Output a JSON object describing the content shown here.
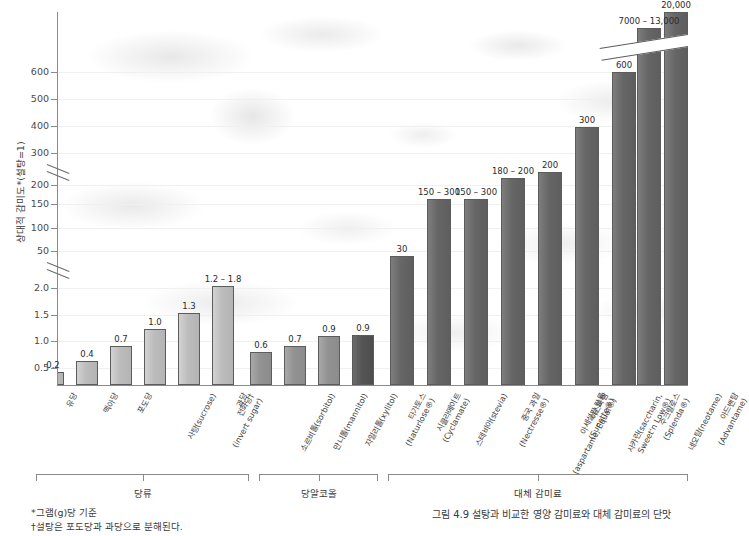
{
  "chart_data": {
    "type": "bar",
    "title": "",
    "ylabel": "상대적 감미도*(설탕=1)",
    "xlabel": "",
    "grid": true,
    "legend": "none",
    "y_axis": {
      "tick_labels": [
        "600",
        "500",
        "400",
        "300",
        "200",
        "150",
        "100",
        "50",
        "2.0",
        "1.5",
        "1.0",
        "0.5"
      ],
      "breaks": 2,
      "note": "두 번의 축 절단(axis break) 포함"
    },
    "categories": [
      "유당",
      "맥아당",
      "포도당",
      "사탕(sucrose)",
      "전화당†(invert sugar)",
      "과당",
      "소르비톨(sorbitol)",
      "만니톨(mannitol)",
      "자일리톨(xylitol)",
      "타가토스(Naturlose®)",
      "시클라메이트(Cyclamate)",
      "스테비아(stevia)",
      "중국 과일(Nectresse®)",
      "아스파탐(aspartame, Equal®)",
      "아세설팜 칼륨(Sunette®)",
      "사카린(saccharin, Sweet'n Low®)",
      "수크랄로스(Splenda®)",
      "네오탐(neotame)",
      "아드밴탐(Advantame)"
    ],
    "values": [
      0.2,
      0.4,
      0.7,
      1.0,
      1.3,
      1.8,
      0.6,
      0.7,
      0.9,
      0.9,
      30,
      225,
      225,
      190,
      200,
      300,
      600,
      13000,
      20000
    ],
    "value_labels": [
      "0.2",
      "0.4",
      "0.7",
      "1.0",
      "1.3",
      "1.2 – 1.8",
      "0.6",
      "0.7",
      "0.9",
      "0.9",
      "30",
      "150 – 300",
      "150 – 300",
      "180 – 200",
      "200",
      "300",
      "600",
      "7000 – 13,000",
      "20,000"
    ],
    "groups": [
      {
        "label": "당류",
        "from": 0,
        "to": 5
      },
      {
        "label": "당알코올",
        "from": 6,
        "to": 9
      },
      {
        "label": "대체 감미료",
        "from": 10,
        "to": 18
      }
    ]
  },
  "bars": [
    {
      "name": "lactose",
      "label": "유당",
      "label2": "",
      "value_label": "0.2",
      "x": 42,
      "w": 22,
      "h": 13,
      "tone": "light"
    },
    {
      "name": "maltose",
      "label": "맥아당",
      "label2": "",
      "value_label": "0.4",
      "x": 76,
      "w": 22,
      "h": 24,
      "tone": "light"
    },
    {
      "name": "glucose",
      "label": "포도당",
      "label2": "",
      "value_label": "0.7",
      "x": 110,
      "w": 22,
      "h": 39,
      "tone": "light"
    },
    {
      "name": "sucrose",
      "label": "사탕(sucrose)",
      "label2": "",
      "value_label": "1.0",
      "x": 144,
      "w": 22,
      "h": 56,
      "tone": "light"
    },
    {
      "name": "invert-sugar",
      "label": "전화당† ",
      "label2": "(invert sugar)",
      "value_label": "1.3",
      "x": 178,
      "w": 22,
      "h": 72,
      "tone": "light"
    },
    {
      "name": "fructose",
      "label": "과당",
      "label2": "",
      "value_label": "1.2 – 1.8",
      "x": 212,
      "w": 22,
      "h": 99,
      "tone": "light"
    },
    {
      "name": "sorbitol",
      "label": "소르비톨(sorbitol)",
      "label2": "",
      "value_label": "0.6",
      "x": 250,
      "w": 22,
      "h": 33,
      "tone": "mid"
    },
    {
      "name": "mannitol",
      "label": "만니톨(mannitol)",
      "label2": "",
      "value_label": "0.7",
      "x": 284,
      "w": 22,
      "h": 39,
      "tone": "mid"
    },
    {
      "name": "xylitol",
      "label": "자일리톨(xylitol)",
      "label2": "",
      "value_label": "0.9",
      "x": 318,
      "w": 22,
      "h": 49,
      "tone": "mid"
    },
    {
      "name": "tagatose",
      "label": "타가토스",
      "label2": "(Naturlose®)",
      "value_label": "0.9",
      "x": 352,
      "w": 22,
      "h": 50,
      "tone": "darker"
    },
    {
      "name": "cyclamate",
      "label": "시클라메이트",
      "label2": "(Cyclamate)",
      "value_label": "30",
      "x": 390,
      "w": 24,
      "h": 129,
      "tone": "dark"
    },
    {
      "name": "stevia",
      "label": "스테비아(stevia)",
      "label2": "",
      "value_label": "150 – 300",
      "x": 427,
      "w": 24,
      "h": 186,
      "tone": "dark"
    },
    {
      "name": "monk-fruit",
      "label": "중국 과일",
      "label2": "(Nectresse®)",
      "value_label": "150 – 300",
      "x": 464,
      "w": 24,
      "h": 186,
      "tone": "dark"
    },
    {
      "name": "aspartame",
      "label": "아스파탐",
      "label2": "(aspartame, Equal®)",
      "value_label": "180 – 200",
      "x": 501,
      "w": 24,
      "h": 207,
      "tone": "dark"
    },
    {
      "name": "ace-k",
      "label": "아세설팜 칼륨",
      "label2": "(Sunette®)",
      "value_label": "200",
      "x": 538,
      "w": 24,
      "h": 213,
      "tone": "dark"
    },
    {
      "name": "saccharin",
      "label": "사카린(saccharin,",
      "label2": "Sweet'n Low®)",
      "value_label": "300",
      "x": 575,
      "w": 24,
      "h": 258,
      "tone": "dark"
    },
    {
      "name": "sucralose",
      "label": "수크랄로스",
      "label2": "(Splenda®)",
      "value_label": "600",
      "x": 612,
      "w": 24,
      "h": 313,
      "tone": "dark"
    },
    {
      "name": "neotame",
      "label": "네오탐(neotame)",
      "label2": "",
      "value_label": "7000 – 13,000",
      "x": 637,
      "w": 24,
      "h": 357,
      "tone": "dark"
    },
    {
      "name": "advantame",
      "label": "아드밴탐",
      "label2": "(Advantame)",
      "value_label": "20,000",
      "x": 664,
      "w": 24,
      "h": 373,
      "tone": "dark"
    }
  ],
  "y_ticks": [
    {
      "label": "600",
      "y": 72
    },
    {
      "label": "500",
      "y": 99
    },
    {
      "label": "400",
      "y": 126
    },
    {
      "label": "300",
      "y": 153
    },
    {
      "label": "200",
      "y": 185
    },
    {
      "label": "150",
      "y": 204
    },
    {
      "label": "100",
      "y": 228
    },
    {
      "label": "50",
      "y": 251
    },
    {
      "label": "2.0",
      "y": 288
    },
    {
      "label": "1.5",
      "y": 315
    },
    {
      "label": "1.0",
      "y": 341
    },
    {
      "label": "0.5",
      "y": 368
    }
  ],
  "axis": {
    "y_title": "상대적 감미도*(설탕=1)"
  },
  "groups": [
    {
      "name": "sugars",
      "label": "당류",
      "left": 36,
      "width": 213
    },
    {
      "name": "sugar-alcohols",
      "label": "당알코올",
      "left": 259,
      "width": 119
    },
    {
      "name": "alt-sweeteners",
      "label": "대체 감미료",
      "left": 388,
      "width": 300
    }
  ],
  "footnotes": [
    "*그램(g)당 기준",
    "†설탕은 포도당과 과당으로 분해된다."
  ],
  "caption": "그림 4.9 설탕과 비교한 영양 감미료와 대체 감미료의 단맛"
}
